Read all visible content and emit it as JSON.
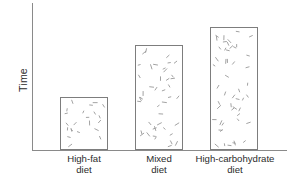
{
  "chart_data": {
    "type": "bar",
    "title": "",
    "subtitle": "",
    "xlabel": "",
    "ylabel": "Time",
    "categories": [
      "High-fat diet",
      "Mixed diet",
      "High-carbohydrate diet"
    ],
    "category_lines": [
      {
        "line1": "High-fat",
        "line2": "diet"
      },
      {
        "line1": "Mixed",
        "line2": "diet"
      },
      {
        "line1": "High-carbohydrate",
        "line2": "diet"
      }
    ],
    "values": [
      53,
      105,
      123
    ],
    "ylim": [
      0,
      147
    ],
    "grid": false,
    "legend": null,
    "tick_labels_y": [],
    "annotations": [],
    "axis_color": "#8a8a8a",
    "bar_fill": "#ffffff",
    "bar_border": "#7d7d7d",
    "texture_color": "#9a9a9a",
    "text_color": "#2b2b2b"
  },
  "figure": {
    "background": "#ffffff",
    "y_axis_name": "y-axis-line",
    "x_axis_name": "x-axis-line"
  }
}
